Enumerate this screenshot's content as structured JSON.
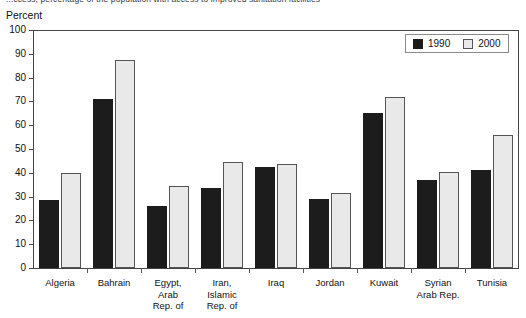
{
  "caption": {
    "text": "...ccess, percentage of the population with access to improved sanitation facilities"
  },
  "legend": {
    "position": "top-right",
    "entries": [
      {
        "label": "1990",
        "color": "#1c1c1c",
        "swatch": "filled-dark-square"
      },
      {
        "label": "2000",
        "color": "#e9e9e9",
        "swatch": "outlined-light-square"
      }
    ]
  },
  "axis": {
    "y_title": "Percent",
    "y_ticks": [
      "100",
      "90",
      "80",
      "70",
      "60",
      "50",
      "40",
      "30",
      "20",
      "10",
      "0"
    ]
  },
  "chart_data": {
    "type": "bar",
    "title": "",
    "xlabel": "",
    "ylabel": "Percent",
    "ylim": [
      0,
      100
    ],
    "ytick_step": 10,
    "grid": false,
    "legend_position": "top-right",
    "categories": [
      "Algeria",
      "Bahrain",
      "Egypt,\nArab\nRep. of",
      "Iran,\nIslamic\nRep. of",
      "Iraq",
      "Jordan",
      "Kuwait",
      "Syrian\nArab Rep.",
      "Tunisia"
    ],
    "series": [
      {
        "name": "1990",
        "color": "#1c1c1c",
        "values": [
          28.5,
          71,
          26,
          33.5,
          42.5,
          29,
          65,
          37,
          41
        ]
      },
      {
        "name": "2000",
        "color": "#e9e9e9",
        "values": [
          40,
          87.5,
          34.5,
          44.5,
          43.5,
          31.5,
          72,
          40.5,
          56
        ]
      }
    ]
  }
}
